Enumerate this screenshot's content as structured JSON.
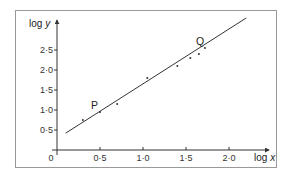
{
  "chart_data": {
    "type": "scatter",
    "title": "",
    "xlabel": "log x",
    "ylabel": "log y",
    "xlim": [
      0,
      2.3
    ],
    "ylim": [
      0,
      3.0
    ],
    "grid": false,
    "legend": null,
    "origin_label": "0",
    "x_ticks": [
      {
        "value": 0.5,
        "label": "0·5"
      },
      {
        "value": 1.0,
        "label": "1·0"
      },
      {
        "value": 1.5,
        "label": "1·5"
      },
      {
        "value": 2.0,
        "label": "2·0"
      }
    ],
    "y_ticks": [
      {
        "value": 0.5,
        "label": "0·5"
      },
      {
        "value": 1.0,
        "label": "1·0"
      },
      {
        "value": 1.5,
        "label": "1·5"
      },
      {
        "value": 2.0,
        "label": "2·0"
      },
      {
        "value": 2.5,
        "label": "2·5"
      }
    ],
    "series": [
      {
        "name": "data points",
        "points": [
          {
            "x": 0.3,
            "y": 0.75
          },
          {
            "x": 0.5,
            "y": 0.95,
            "label": "P"
          },
          {
            "x": 0.7,
            "y": 1.15
          },
          {
            "x": 1.05,
            "y": 1.8
          },
          {
            "x": 1.4,
            "y": 2.1
          },
          {
            "x": 1.55,
            "y": 2.3
          },
          {
            "x": 1.65,
            "y": 2.4
          },
          {
            "x": 1.72,
            "y": 2.55,
            "label": "Q"
          }
        ]
      },
      {
        "name": "line of best fit",
        "type": "line",
        "points": [
          {
            "x": 0.1,
            "y": 0.42
          },
          {
            "x": 2.2,
            "y": 3.3
          }
        ]
      }
    ],
    "annotations": [
      {
        "text": "P",
        "x": 0.5,
        "y": 0.95
      },
      {
        "text": "Q",
        "x": 1.72,
        "y": 2.55
      }
    ]
  },
  "colors": {
    "line": "#333333",
    "frame": "#888888",
    "text": "#333333"
  }
}
